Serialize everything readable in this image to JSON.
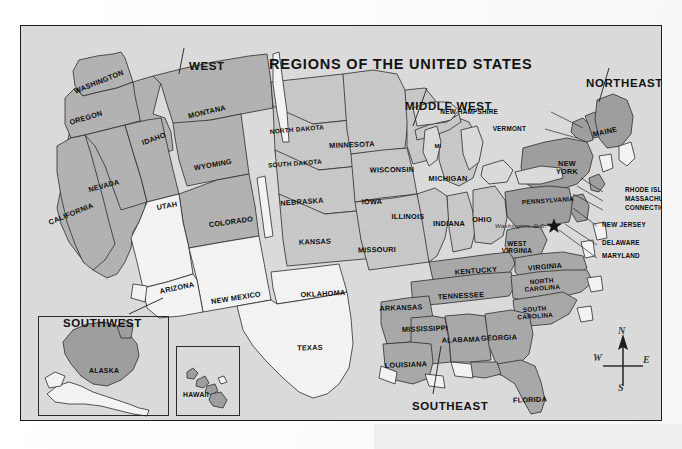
{
  "map": {
    "title": "REGIONS OF THE UNITED STATES",
    "capital_marker": "Washington, D.C.",
    "regions": [
      {
        "key": "west",
        "label": "WEST"
      },
      {
        "key": "middle_west",
        "label": "MIDDLE WEST"
      },
      {
        "key": "northeast",
        "label": "NORTHEAST"
      },
      {
        "key": "southeast",
        "label": "SOUTHEAST"
      },
      {
        "key": "southwest",
        "label": "SOUTHWEST"
      }
    ],
    "colors": {
      "plate_background": "#dcdcdc",
      "plate_border": "#1d1d1d",
      "region_west_fill": "#b3b3b3",
      "region_middle_west_fill": "#c9c9c9",
      "region_northeast_fill": "#9f9f9f",
      "region_southeast_fill": "#a9a9a9",
      "region_southwest_fill": "#f4f4f4",
      "state_outline": "#2b2b2b",
      "label_text": "#0b0b0b",
      "page_background": "#fbfbfb"
    },
    "states": {
      "west": [
        {
          "name": "WASHINGTON",
          "x": 78,
          "y": 56,
          "rot": -22
        },
        {
          "name": "OREGON",
          "x": 65,
          "y": 92,
          "rot": -17
        },
        {
          "name": "IDAHO",
          "x": 133,
          "y": 113,
          "rot": -20
        },
        {
          "name": "MONTANA",
          "x": 186,
          "y": 86,
          "rot": -13
        },
        {
          "name": "WYOMING",
          "x": 192,
          "y": 139,
          "rot": -10
        },
        {
          "name": "NEVADA",
          "x": 83,
          "y": 160,
          "rot": -15
        },
        {
          "name": "CALIFORNIA",
          "x": 50,
          "y": 188,
          "rot": -22
        },
        {
          "name": "UTAH",
          "x": 146,
          "y": 180,
          "rot": -10
        },
        {
          "name": "COLORADO",
          "x": 210,
          "y": 196,
          "rot": -8
        }
      ],
      "middle_west": [
        {
          "name": "NORTH DAKOTA",
          "x": 276,
          "y": 104,
          "rot": -5
        },
        {
          "name": "SOUTH DAKOTA",
          "x": 274,
          "y": 138,
          "rot": -4
        },
        {
          "name": "NEBRASKA",
          "x": 281,
          "y": 176,
          "rot": -4
        },
        {
          "name": "KANSAS",
          "x": 294,
          "y": 216,
          "rot": -2
        },
        {
          "name": "MINNESOTA",
          "x": 331,
          "y": 119,
          "rot": -2
        },
        {
          "name": "IOWA",
          "x": 351,
          "y": 176,
          "rot": -1
        },
        {
          "name": "MISSOURI",
          "x": 356,
          "y": 224,
          "rot": -1
        },
        {
          "name": "WISCONSIN",
          "x": 371,
          "y": 144,
          "rot": -1
        },
        {
          "name": "MI",
          "x": 417,
          "y": 120,
          "rot": 0
        },
        {
          "name": "MICHIGAN",
          "x": 427,
          "y": 153,
          "rot": 0
        },
        {
          "name": "ILLINOIS",
          "x": 387,
          "y": 191,
          "rot": 0
        },
        {
          "name": "INDIANA",
          "x": 428,
          "y": 198,
          "rot": 0
        },
        {
          "name": "OHIO",
          "x": 461,
          "y": 194,
          "rot": 0
        }
      ],
      "northeast": [
        {
          "name": "MAINE",
          "x": 584,
          "y": 106,
          "rot": -12
        },
        {
          "name": "NEW\nYORK",
          "x": 546,
          "y": 142,
          "rot": 0
        },
        {
          "name": "PENNSYLVANIA",
          "x": 527,
          "y": 175,
          "rot": -4
        }
      ],
      "southeast": [
        {
          "name": "WEST\nVIRGINIA",
          "x": 496,
          "y": 222,
          "rot": 0
        },
        {
          "name": "VIRGINIA",
          "x": 524,
          "y": 241,
          "rot": -5
        },
        {
          "name": "KENTUCKY",
          "x": 455,
          "y": 245,
          "rot": -4
        },
        {
          "name": "TENNESSEE",
          "x": 440,
          "y": 270,
          "rot": -3
        },
        {
          "name": "NORTH\nCAROLINA",
          "x": 521,
          "y": 259,
          "rot": -5
        },
        {
          "name": "SOUTH\nCAROLINA",
          "x": 514,
          "y": 287,
          "rot": -4
        },
        {
          "name": "ARKANSAS",
          "x": 380,
          "y": 282,
          "rot": -2
        },
        {
          "name": "MISSISSIPPI",
          "x": 404,
          "y": 303,
          "rot": -2
        },
        {
          "name": "ALABAMA",
          "x": 440,
          "y": 314,
          "rot": -2
        },
        {
          "name": "GEORGIA",
          "x": 478,
          "y": 312,
          "rot": -2
        },
        {
          "name": "LOUISIANA",
          "x": 385,
          "y": 339,
          "rot": -2
        },
        {
          "name": "FLORIDA",
          "x": 509,
          "y": 374,
          "rot": -2
        }
      ],
      "southwest": [
        {
          "name": "ARIZONA",
          "x": 156,
          "y": 262,
          "rot": -12
        },
        {
          "name": "NEW MEXICO",
          "x": 215,
          "y": 272,
          "rot": -9
        },
        {
          "name": "OKLAHOMA",
          "x": 302,
          "y": 268,
          "rot": -3
        },
        {
          "name": "TEXAS",
          "x": 289,
          "y": 322,
          "rot": -2
        }
      ]
    },
    "callouts": [
      {
        "name": "NEW HAMPSHIRE",
        "x": 477,
        "y": 86,
        "anchor": "right"
      },
      {
        "name": "VERMONT",
        "x": 505,
        "y": 103,
        "anchor": "right"
      },
      {
        "name": "RHODE ISLAND",
        "x": 604,
        "y": 164,
        "anchor": "left"
      },
      {
        "name": "MASSACHUSETTS",
        "x": 604,
        "y": 173,
        "anchor": "left"
      },
      {
        "name": "CONNECTICUT",
        "x": 604,
        "y": 182,
        "anchor": "left"
      },
      {
        "name": "NEW JERSEY",
        "x": 581,
        "y": 199,
        "anchor": "left"
      },
      {
        "name": "DELAWARE",
        "x": 581,
        "y": 217,
        "anchor": "left"
      },
      {
        "name": "MARYLAND",
        "x": 581,
        "y": 230,
        "anchor": "left"
      }
    ],
    "insets": [
      {
        "key": "alaska",
        "label": "ALASKA",
        "label_x": 68,
        "label_y": 341
      },
      {
        "key": "hawaii",
        "label": "HAWAII",
        "label_x": 170,
        "label_y": 369
      }
    ],
    "compass": {
      "north": "N",
      "south": "S",
      "east": "E",
      "west": "W"
    }
  }
}
